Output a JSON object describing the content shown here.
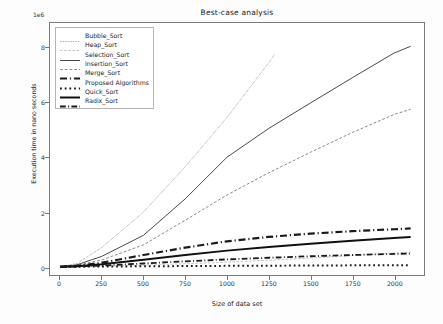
{
  "chart_data": {
    "type": "line",
    "title": "Best-case analysis",
    "xlabel": "Size of data set",
    "ylabel": "Execution time in nano seconds",
    "y_offset_text": "1e6",
    "xlim": [
      -60,
      2180
    ],
    "ylim": [
      -300000,
      8900000
    ],
    "grid": false,
    "legend_position": "upper left",
    "xticks": [
      0,
      250,
      500,
      750,
      1000,
      1250,
      1500,
      1750,
      2000
    ],
    "xtick_labels": [
      "0",
      "250",
      "500",
      "750",
      "1000",
      "1250",
      "1500",
      "1750",
      "2000"
    ],
    "yticks": [
      0,
      2000000,
      4000000,
      6000000,
      8000000
    ],
    "ytick_labels": [
      "0",
      "2",
      "4",
      "6",
      "8"
    ],
    "x": [
      0,
      100,
      250,
      500,
      750,
      1000,
      1250,
      1500,
      1750,
      2000,
      2100
    ],
    "series": [
      {
        "name": "Bubble_Sort",
        "style": "dotted-thin",
        "color": "#555555",
        "width": 0.7,
        "clipped_at_x": 1285,
        "values": [
          0,
          120000,
          700000,
          2000000,
          3650000,
          5450000,
          7450000,
          9600000,
          11900000,
          14300000,
          15200000
        ]
      },
      {
        "name": "Heap_Sort",
        "style": "dashed-faint",
        "color": "#aaaaaa",
        "width": 0.7,
        "values": [
          0,
          8000,
          25000,
          60000,
          110000,
          170000,
          240000,
          320000,
          410000,
          500000,
          540000
        ]
      },
      {
        "name": "Selection_Sort",
        "style": "solid-thin",
        "color": "#333333",
        "width": 0.9,
        "values": [
          0,
          70000,
          380000,
          1150000,
          2480000,
          4000000,
          5050000,
          5980000,
          6900000,
          7800000,
          8050000
        ]
      },
      {
        "name": "Insertion_Sort",
        "style": "dashed-thin",
        "color": "#6b6b6b",
        "width": 0.8,
        "values": [
          0,
          50000,
          250000,
          800000,
          1700000,
          2620000,
          3430000,
          4180000,
          4900000,
          5560000,
          5750000
        ]
      },
      {
        "name": "Merge_Sort",
        "style": "dash-dot-thick",
        "color": "#1a1a1a",
        "width": 2.2,
        "values": [
          0,
          30000,
          150000,
          430000,
          700000,
          930000,
          1090000,
          1210000,
          1300000,
          1370000,
          1400000
        ]
      },
      {
        "name": "Proposed Algorithms",
        "style": "dotted-thick",
        "color": "#1a1a1a",
        "width": 2.0,
        "values": [
          0,
          4000,
          9000,
          18000,
          26000,
          34000,
          40000,
          46000,
          52000,
          58000,
          60000
        ]
      },
      {
        "name": "Quick_Sort",
        "style": "solid-thick",
        "color": "#111111",
        "width": 2.0,
        "values": [
          0,
          20000,
          95000,
          260000,
          430000,
          590000,
          720000,
          840000,
          950000,
          1050000,
          1090000
        ]
      },
      {
        "name": "Radix_Sort",
        "style": "dash-dot-medium",
        "color": "#1a1a1a",
        "width": 1.8,
        "values": [
          0,
          10000,
          45000,
          120000,
          200000,
          270000,
          330000,
          385000,
          430000,
          470000,
          485000
        ]
      }
    ]
  }
}
